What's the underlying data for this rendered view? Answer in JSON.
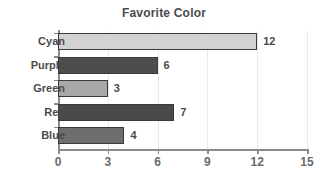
{
  "chart_data": {
    "type": "bar",
    "orientation": "horizontal",
    "title": "Favorite Color",
    "xlabel": "",
    "ylabel": "",
    "categories": [
      "Cyan",
      "Purple",
      "Green",
      "Red",
      "Blue"
    ],
    "values": [
      12,
      6,
      3,
      7,
      4
    ],
    "value_labels": [
      "12",
      "6",
      "3",
      "7",
      "4"
    ],
    "bar_colors": [
      "#d2d2d2",
      "#4d4d4d",
      "#a8a8a8",
      "#4a4a4a",
      "#6e6e6e"
    ],
    "bar_border_color": "#3a3a3a",
    "xlim": [
      0,
      15
    ],
    "xticks": [
      0,
      3,
      6,
      9,
      12,
      15
    ],
    "xtick_labels": [
      "0",
      "3",
      "6",
      "9",
      "12",
      "15"
    ],
    "grid": true,
    "grid_axis": "x",
    "legend": false,
    "title_color": "#4b4b4b",
    "axis_color": "#8a8a8a",
    "label_color": "#4b4b4b",
    "tick_label_color": "#6b6b6b",
    "background": "#ffffff"
  }
}
